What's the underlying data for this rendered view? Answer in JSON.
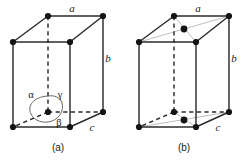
{
  "figure": {
    "background_color": "#ffffff",
    "edge_color": "#2b2b2b",
    "diagonal_color": "#b9b9b9",
    "dot_color": "#141414",
    "arc_color": "#5d5d5d"
  },
  "panels": [
    {
      "id": "panel-a",
      "caption": "(a)",
      "caption_x": 58,
      "caption_y": 151,
      "lattice_type": "primitive",
      "axis_labels": [
        {
          "name": "a",
          "text": "a",
          "x": 72,
          "y": 12
        },
        {
          "name": "b",
          "text": "b",
          "x": 108,
          "y": 62
        },
        {
          "name": "c",
          "text": "c",
          "x": 92,
          "y": 131
        }
      ],
      "angle_labels": [
        {
          "name": "alpha",
          "text": "α",
          "x": 31,
          "y": 98
        },
        {
          "name": "gamma",
          "text": "γ",
          "x": 60,
          "y": 98
        },
        {
          "name": "beta",
          "text": "β",
          "x": 59,
          "y": 126
        }
      ],
      "vertices": [
        {
          "name": "front-top-left",
          "x": 13,
          "y": 42
        },
        {
          "name": "front-top-right",
          "x": 70,
          "y": 42
        },
        {
          "name": "back-top-left",
          "x": 48,
          "y": 16
        },
        {
          "name": "back-top-right",
          "x": 103,
          "y": 16
        },
        {
          "name": "front-bottom-left",
          "x": 13,
          "y": 127
        },
        {
          "name": "front-bottom-right",
          "x": 70,
          "y": 127
        },
        {
          "name": "back-bottom-left-origin",
          "x": 48,
          "y": 112
        },
        {
          "name": "back-bottom-right",
          "x": 103,
          "y": 112
        }
      ],
      "face_center_dots": []
    },
    {
      "id": "panel-b",
      "caption": "(b)",
      "caption_x": 184,
      "caption_y": 151,
      "lattice_type": "base-centered",
      "axis_labels": [
        {
          "name": "a",
          "text": "a",
          "x": 198,
          "y": 12
        },
        {
          "name": "b",
          "text": "b",
          "x": 234,
          "y": 62
        },
        {
          "name": "c",
          "text": "c",
          "x": 218,
          "y": 131
        }
      ],
      "angle_labels": [],
      "vertices": [
        {
          "name": "front-top-left",
          "x": 139,
          "y": 42
        },
        {
          "name": "front-top-right",
          "x": 196,
          "y": 42
        },
        {
          "name": "back-top-left",
          "x": 174,
          "y": 16
        },
        {
          "name": "back-top-right",
          "x": 229,
          "y": 16
        },
        {
          "name": "front-bottom-left",
          "x": 139,
          "y": 127
        },
        {
          "name": "front-bottom-right",
          "x": 196,
          "y": 127
        },
        {
          "name": "back-bottom-left",
          "x": 174,
          "y": 112
        },
        {
          "name": "back-bottom-right",
          "x": 229,
          "y": 112
        }
      ],
      "face_center_dots": [
        {
          "name": "top-face-center",
          "x": 184,
          "y": 29
        },
        {
          "name": "bottom-face-center",
          "x": 184,
          "y": 120
        }
      ]
    }
  ]
}
